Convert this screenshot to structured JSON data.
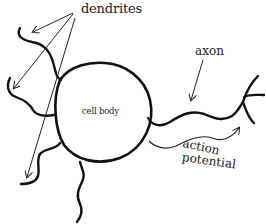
{
  "diagram": {
    "type": "neuron",
    "labels": {
      "dendrites": "dendrites",
      "axon": "axon",
      "cell_body": "cell body",
      "action_line1": "action",
      "action_line2": "potential"
    },
    "colors": {
      "stroke": "#111111",
      "text": "#222222",
      "background": "#ffffff"
    },
    "annotations": [
      {
        "label": "dendrites",
        "points_to": [
          "upper-left dendrite",
          "left dendrite",
          "lower-left dendrite"
        ]
      },
      {
        "label": "axon",
        "points_to": [
          "axon"
        ]
      },
      {
        "label": "action potential",
        "direction": "left-to-right along axon"
      }
    ]
  }
}
